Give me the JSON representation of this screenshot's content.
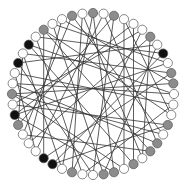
{
  "graph": {
    "type": "circular-network",
    "center": [
      93,
      94
    ],
    "ring_radius": 81,
    "node_radius": 4.6,
    "start_angle_deg": -90,
    "colors": {
      "white": "#ffffff",
      "gray": "#8c8c8c",
      "black": "#111111",
      "stroke": "#555555",
      "edge": "#333333"
    },
    "nodes": [
      "gray",
      "white",
      "gray",
      "white",
      "white",
      "white",
      "gray",
      "white",
      "black",
      "white",
      "gray",
      "gray",
      "white",
      "white",
      "white",
      "gray",
      "white",
      "gray",
      "gray",
      "white",
      "gray",
      "white",
      "gray",
      "gray",
      "white",
      "white",
      "gray",
      "white",
      "black",
      "black",
      "white",
      "white",
      "white",
      "gray",
      "black",
      "white",
      "gray",
      "white",
      "white",
      "black",
      "white",
      "black",
      "white",
      "gray",
      "white",
      "white",
      "gray",
      "white"
    ],
    "edges": [
      [
        0,
        22
      ],
      [
        0,
        27
      ],
      [
        1,
        30
      ],
      [
        2,
        24
      ],
      [
        2,
        33
      ],
      [
        3,
        21
      ],
      [
        4,
        34
      ],
      [
        5,
        26
      ],
      [
        6,
        19
      ],
      [
        6,
        31
      ],
      [
        7,
        39
      ],
      [
        8,
        42
      ],
      [
        8,
        28
      ],
      [
        9,
        44
      ],
      [
        10,
        40
      ],
      [
        11,
        36
      ],
      [
        11,
        45
      ],
      [
        12,
        41
      ],
      [
        13,
        38
      ],
      [
        14,
        43
      ],
      [
        15,
        35
      ],
      [
        16,
        46
      ],
      [
        17,
        37
      ],
      [
        18,
        32
      ],
      [
        19,
        47
      ],
      [
        20,
        41
      ],
      [
        21,
        36
      ],
      [
        23,
        44
      ],
      [
        24,
        39
      ],
      [
        25,
        42
      ],
      [
        26,
        47
      ],
      [
        27,
        40
      ],
      [
        29,
        43
      ],
      [
        30,
        38
      ],
      [
        31,
        45
      ],
      [
        32,
        46
      ],
      [
        33,
        40
      ],
      [
        34,
        9
      ],
      [
        35,
        5
      ],
      [
        37,
        12
      ],
      [
        1,
        17
      ],
      [
        3,
        14
      ],
      [
        4,
        20
      ],
      [
        7,
        23
      ],
      [
        10,
        29
      ],
      [
        13,
        25
      ],
      [
        15,
        28
      ],
      [
        16,
        36
      ],
      [
        18,
        43
      ],
      [
        22,
        34
      ]
    ]
  }
}
